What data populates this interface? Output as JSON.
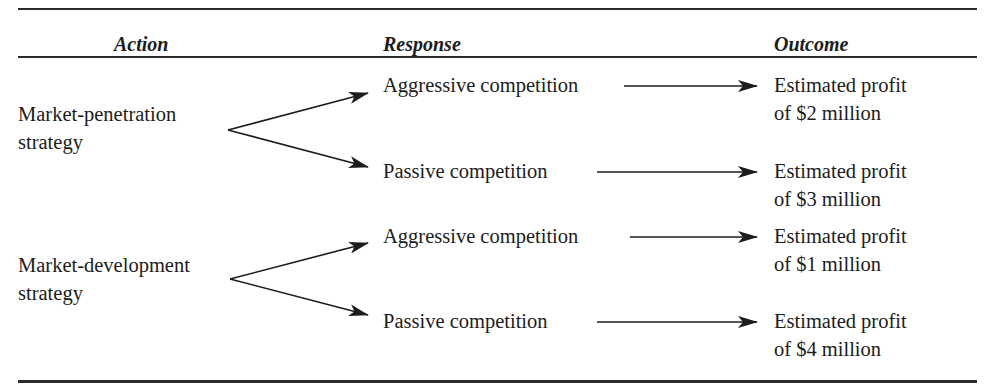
{
  "table": {
    "headers": {
      "action": "Action",
      "response": "Response",
      "outcome": "Outcome"
    },
    "actions": [
      {
        "label_line1": "Market-penetration",
        "label_line2": "strategy",
        "responses": [
          {
            "label": "Aggressive competition",
            "outcome_line1": "Estimated profit",
            "outcome_line2": "of $2 million"
          },
          {
            "label": "Passive competition",
            "outcome_line1": "Estimated profit",
            "outcome_line2": "of $3 million"
          }
        ]
      },
      {
        "label_line1": "Market-development",
        "label_line2": "strategy",
        "responses": [
          {
            "label": "Aggressive competition",
            "outcome_line1": "Estimated profit",
            "outcome_line2": "of $1 million"
          },
          {
            "label": "Passive competition",
            "outcome_line1": "Estimated profit",
            "outcome_line2": "of $4 million"
          }
        ]
      }
    ]
  },
  "colors": {
    "ink": "#1c1c1c",
    "rule": "#2a2a2a",
    "background": "#ffffff"
  }
}
